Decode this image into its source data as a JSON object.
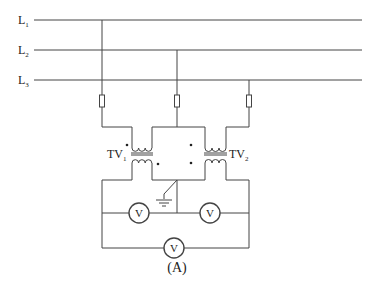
{
  "diagram": {
    "caption": "(A)",
    "lines": [
      {
        "label": "L",
        "sub": "1"
      },
      {
        "label": "L",
        "sub": "2"
      },
      {
        "label": "L",
        "sub": "3"
      }
    ],
    "transformers": [
      {
        "label": "TV",
        "sub": "1"
      },
      {
        "label": "TV",
        "sub": "2"
      }
    ],
    "voltmeter_symbol": "V",
    "colors": {
      "wire": "#444444",
      "text": "#222222",
      "background": "#ffffff"
    }
  }
}
